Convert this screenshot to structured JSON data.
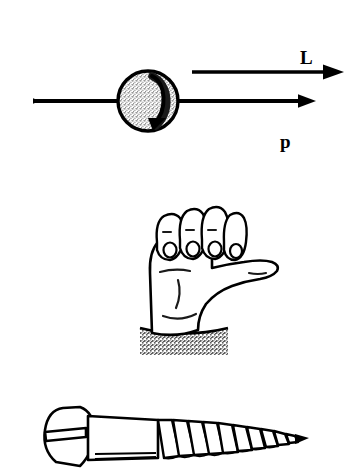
{
  "figure": {
    "title_visible": false,
    "background_color": "#ffffff",
    "ink_color": "#000000",
    "panels": [
      {
        "id": "spinning-ball",
        "description": "Spinning ball on a momentum arrow with angular momentum arrow above"
      },
      {
        "id": "right-hand",
        "description": "Right hand with curled fingers and extended thumb"
      },
      {
        "id": "screw",
        "description": "Slotted wood screw with right-hand threads"
      }
    ]
  },
  "vectors": {
    "angular_momentum": {
      "label": "L",
      "direction": "right",
      "x_start": 192,
      "x_end": 340,
      "y": 72
    },
    "momentum": {
      "label": "p",
      "direction": "right",
      "x_start": 33,
      "x_end": 312,
      "y": 101
    }
  },
  "ball": {
    "center_x": 148,
    "center_y": 101,
    "radius": 31,
    "fill": "stipple",
    "fill_color": "#d8d8d8",
    "spin_arrow": "clockwise-crescent"
  },
  "hand": {
    "label": "R.H.",
    "orientation": "right-hand",
    "fingers": 4,
    "thumb_direction": "right",
    "base_fill": "stipple",
    "base_color": "#9a9a9a"
  },
  "screw": {
    "head_type": "slotted-oval",
    "thread_count": 10,
    "tip_direction": "right",
    "head_x": 42,
    "tip_x": 305
  },
  "colors": {
    "ink": "#000000",
    "paper": "#ffffff",
    "stipple_light": "#d8d8d8",
    "stipple_dark": "#8f8f8f"
  }
}
